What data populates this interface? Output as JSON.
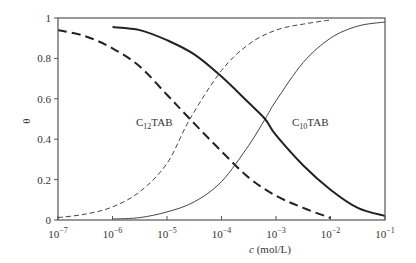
{
  "chart_data": {
    "type": "line",
    "title": "",
    "xlabel": "c (mol/L)",
    "xlabel_italic": "c",
    "xlabel_unit": " (mol/L)",
    "ylabel": "θ",
    "xscale": "log",
    "xlim": [
      1e-07,
      0.1
    ],
    "ylim": [
      0,
      1
    ],
    "grid": false,
    "legend": "inline labels",
    "x_ticks": [
      {
        "exp": -7,
        "base": "10",
        "sup": "−7"
      },
      {
        "exp": -6,
        "base": "10",
        "sup": "−6"
      },
      {
        "exp": -5,
        "base": "10",
        "sup": "−5"
      },
      {
        "exp": -4,
        "base": "10",
        "sup": "−4"
      },
      {
        "exp": -3,
        "base": "10",
        "sup": "−3"
      },
      {
        "exp": -2,
        "base": "10",
        "sup": "−2"
      },
      {
        "exp": -1,
        "base": "10",
        "sup": "−1"
      }
    ],
    "y_ticks": [
      "0",
      "0.2",
      "0.4",
      "0.6",
      "0.8",
      "1"
    ],
    "y_tick_values": [
      0,
      0.2,
      0.4,
      0.6,
      0.8,
      1
    ],
    "annotations": [
      {
        "text_main": "C",
        "text_sub": "12",
        "text_rest": "TAB",
        "x": 2.2e-05,
        "y": 0.5
      },
      {
        "text_main": "C",
        "text_sub": "10",
        "text_rest": "TAB",
        "x": 0.0009,
        "y": 0.5
      }
    ],
    "series": [
      {
        "name": "C12TAB rising (thin dashed)",
        "style": "thin-dashed",
        "log_c": [
          -7.0,
          -6.5,
          -6.0,
          -5.5,
          -5.0,
          -4.58,
          -4.0,
          -3.5,
          -3.0,
          -2.5,
          -2.0
        ],
        "theta": [
          0.012,
          0.029,
          0.065,
          0.14,
          0.28,
          0.5,
          0.74,
          0.87,
          0.94,
          0.97,
          0.99
        ]
      },
      {
        "name": "C12TAB falling (thick dashed)",
        "style": "thick-dashed",
        "log_c": [
          -7.0,
          -6.5,
          -6.0,
          -5.5,
          -5.0,
          -4.58,
          -4.0,
          -3.5,
          -3.0,
          -2.5,
          -2.0
        ],
        "theta": [
          0.94,
          0.91,
          0.85,
          0.76,
          0.62,
          0.5,
          0.34,
          0.21,
          0.12,
          0.06,
          0.01
        ]
      },
      {
        "name": "C10TAB rising (thin solid)",
        "style": "thin-solid",
        "log_c": [
          -6.0,
          -5.5,
          -5.0,
          -4.5,
          -4.0,
          -3.5,
          -3.2,
          -3.0,
          -2.5,
          -2.0,
          -1.5,
          -1.0
        ],
        "theta": [
          0.005,
          0.012,
          0.04,
          0.09,
          0.19,
          0.37,
          0.5,
          0.59,
          0.78,
          0.9,
          0.96,
          0.98
        ]
      },
      {
        "name": "C10TAB falling (thick solid)",
        "style": "thick-solid",
        "log_c": [
          -6.0,
          -5.5,
          -5.0,
          -4.5,
          -4.0,
          -3.5,
          -3.2,
          -3.0,
          -2.5,
          -2.0,
          -1.5,
          -1.0
        ],
        "theta": [
          0.955,
          0.94,
          0.89,
          0.82,
          0.71,
          0.58,
          0.5,
          0.42,
          0.27,
          0.15,
          0.06,
          0.02
        ]
      }
    ]
  }
}
